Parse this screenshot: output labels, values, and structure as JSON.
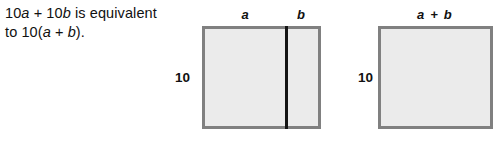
{
  "statement": {
    "line1_prefix": "10",
    "line1_var1": "a",
    "line1_mid": " + 10",
    "line1_var2": "b",
    "line1_suffix": " is equivalent",
    "line2_prefix": "to 10(",
    "line2_var1": "a",
    "line2_mid": " + ",
    "line2_var2": "b",
    "line2_suffix": ")."
  },
  "figures": [
    {
      "id": "split-rectangle",
      "top_label_left": "a",
      "top_label_right": "b",
      "side_label": "10",
      "has_divider": true
    },
    {
      "id": "whole-rectangle",
      "top_label": "a + b",
      "side_label": "10",
      "has_divider": false
    }
  ],
  "colors": {
    "border": "#808080",
    "fill": "#ebebeb",
    "divider": "#141414",
    "text": "#111111",
    "background": "#ffffff"
  }
}
